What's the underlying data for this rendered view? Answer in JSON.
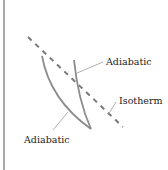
{
  "diagram": {
    "labels": {
      "adiabatic_upper": "Adiabatic",
      "isotherm": "Isotherm",
      "adiabatic_lower": "Adiabatic"
    },
    "colors": {
      "curve": "#8c8c8c",
      "border": "#8c8c8c",
      "leader": "#9a9a9a",
      "text": "#222222"
    }
  }
}
